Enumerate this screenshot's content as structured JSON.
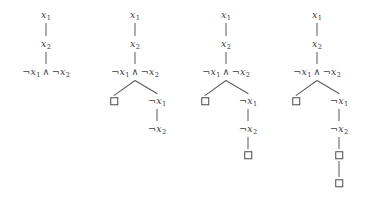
{
  "figure": {
    "width": 372,
    "height": 205,
    "line_color": "#5a5a5a",
    "text_color": "#3d3d3d",
    "background": "#ffffff",
    "symbols": {
      "negation": "¬",
      "conjunction": "∧",
      "empty_clause": "□"
    }
  },
  "labels": {
    "x1": "x",
    "x1_sub": "1",
    "x2": "x",
    "x2_sub": "2",
    "neg": "¬",
    "conj": "∧"
  },
  "trees": [
    {
      "name": "tree-1",
      "center_x": 46,
      "nodes": [
        {
          "id": "t1-n1",
          "kind": "text",
          "text": "x1",
          "x": 46,
          "y": 15
        },
        {
          "id": "t1-n2",
          "kind": "text",
          "text": "x2",
          "x": 46,
          "y": 44
        },
        {
          "id": "t1-n3",
          "kind": "text",
          "text": "neg-x1-and-neg-x2",
          "x": 46,
          "y": 72
        }
      ],
      "edges": [
        {
          "from": "t1-n1",
          "to": "t1-n2"
        },
        {
          "from": "t1-n2",
          "to": "t1-n3"
        }
      ]
    },
    {
      "name": "tree-2",
      "center_x": 135,
      "nodes": [
        {
          "id": "t2-n1",
          "kind": "text",
          "text": "x1",
          "x": 135,
          "y": 15
        },
        {
          "id": "t2-n2",
          "kind": "text",
          "text": "x2",
          "x": 135,
          "y": 44
        },
        {
          "id": "t2-n3",
          "kind": "text",
          "text": "neg-x1-and-neg-x2",
          "x": 135,
          "y": 72
        },
        {
          "id": "t2-n4",
          "kind": "box",
          "text": "□",
          "x": 114,
          "y": 101
        },
        {
          "id": "t2-n5",
          "kind": "text",
          "text": "neg-x1",
          "x": 157,
          "y": 101
        },
        {
          "id": "t2-n6",
          "kind": "text",
          "text": "neg-x2",
          "x": 157,
          "y": 129
        }
      ],
      "edges": [
        {
          "from": "t2-n1",
          "to": "t2-n2"
        },
        {
          "from": "t2-n2",
          "to": "t2-n3"
        },
        {
          "from": "t2-n3",
          "to": "t2-n4"
        },
        {
          "from": "t2-n3",
          "to": "t2-n5"
        },
        {
          "from": "t2-n5",
          "to": "t2-n6"
        }
      ]
    },
    {
      "name": "tree-3",
      "center_x": 226,
      "nodes": [
        {
          "id": "t3-n1",
          "kind": "text",
          "text": "x1",
          "x": 226,
          "y": 15
        },
        {
          "id": "t3-n2",
          "kind": "text",
          "text": "x2",
          "x": 226,
          "y": 44
        },
        {
          "id": "t3-n3",
          "kind": "text",
          "text": "neg-x1-and-neg-x2",
          "x": 226,
          "y": 72
        },
        {
          "id": "t3-n4",
          "kind": "box",
          "text": "□",
          "x": 205,
          "y": 101
        },
        {
          "id": "t3-n5",
          "kind": "text",
          "text": "neg-x1",
          "x": 248,
          "y": 101
        },
        {
          "id": "t3-n6",
          "kind": "text",
          "text": "neg-x2",
          "x": 248,
          "y": 129
        },
        {
          "id": "t3-n7",
          "kind": "box",
          "text": "□",
          "x": 248,
          "y": 155
        }
      ],
      "edges": [
        {
          "from": "t3-n1",
          "to": "t3-n2"
        },
        {
          "from": "t3-n2",
          "to": "t3-n3"
        },
        {
          "from": "t3-n3",
          "to": "t3-n4"
        },
        {
          "from": "t3-n3",
          "to": "t3-n5"
        },
        {
          "from": "t3-n5",
          "to": "t3-n6"
        },
        {
          "from": "t3-n6",
          "to": "t3-n7"
        }
      ]
    },
    {
      "name": "tree-4",
      "center_x": 317,
      "nodes": [
        {
          "id": "t4-n1",
          "kind": "text",
          "text": "x1",
          "x": 317,
          "y": 15
        },
        {
          "id": "t4-n2",
          "kind": "text",
          "text": "x2",
          "x": 317,
          "y": 44
        },
        {
          "id": "t4-n3",
          "kind": "text",
          "text": "neg-x1-and-neg-x2",
          "x": 317,
          "y": 72
        },
        {
          "id": "t4-n4",
          "kind": "box",
          "text": "□",
          "x": 296,
          "y": 101
        },
        {
          "id": "t4-n5",
          "kind": "text",
          "text": "neg-x1",
          "x": 339,
          "y": 101
        },
        {
          "id": "t4-n6",
          "kind": "text",
          "text": "neg-x2",
          "x": 339,
          "y": 129
        },
        {
          "id": "t4-n7",
          "kind": "box",
          "text": "□",
          "x": 339,
          "y": 155
        },
        {
          "id": "t4-n8",
          "kind": "box",
          "text": "□",
          "x": 339,
          "y": 183
        }
      ],
      "edges": [
        {
          "from": "t4-n1",
          "to": "t4-n2"
        },
        {
          "from": "t4-n2",
          "to": "t4-n3"
        },
        {
          "from": "t4-n3",
          "to": "t4-n4"
        },
        {
          "from": "t4-n3",
          "to": "t4-n5"
        },
        {
          "from": "t4-n5",
          "to": "t4-n6"
        },
        {
          "from": "t4-n6",
          "to": "t4-n7"
        },
        {
          "from": "t4-n7",
          "to": "t4-n8"
        }
      ]
    }
  ]
}
